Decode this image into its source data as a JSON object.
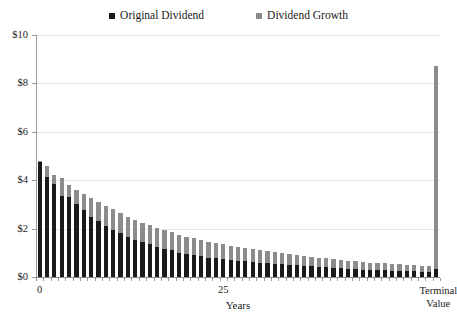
{
  "chart_data": {
    "type": "bar",
    "title": "",
    "xlabel": "Years",
    "ylabel": "",
    "stacked": true,
    "grid": true,
    "legend_position": "top-center",
    "ylim": [
      0,
      10
    ],
    "yticks": [
      0,
      2,
      4,
      6,
      8,
      10
    ],
    "ytick_labels": [
      "$0",
      "$2",
      "$4",
      "$6",
      "$8",
      "$10"
    ],
    "xtick_positions": [
      0,
      25,
      54
    ],
    "xtick_labels": [
      "0",
      "25",
      "Terminal Value"
    ],
    "terminal_label_line1": "Terminal",
    "terminal_label_line2": "Value",
    "series": [
      {
        "name": "Original Dividend",
        "color": "#1a1a1a",
        "values": [
          4.75,
          4.15,
          3.85,
          3.35,
          3.3,
          3.0,
          2.75,
          2.5,
          2.3,
          2.1,
          1.95,
          1.8,
          1.65,
          1.55,
          1.45,
          1.35,
          1.25,
          1.15,
          1.1,
          1.0,
          0.95,
          0.9,
          0.85,
          0.8,
          0.78,
          0.75,
          0.72,
          0.68,
          0.65,
          0.62,
          0.6,
          0.58,
          0.55,
          0.53,
          0.5,
          0.48,
          0.46,
          0.44,
          0.42,
          0.4,
          0.38,
          0.36,
          0.34,
          0.32,
          0.3,
          0.29,
          0.28,
          0.27,
          0.26,
          0.25,
          0.24,
          0.23,
          0.22,
          0.21,
          0.35
        ]
      },
      {
        "name": "Dividend Growth",
        "color": "#8c8c8c",
        "values": [
          0.05,
          0.45,
          0.35,
          0.75,
          0.5,
          0.6,
          0.7,
          0.75,
          0.8,
          0.85,
          0.85,
          0.85,
          0.85,
          0.82,
          0.8,
          0.78,
          0.78,
          0.78,
          0.75,
          0.75,
          0.72,
          0.7,
          0.68,
          0.66,
          0.62,
          0.6,
          0.58,
          0.57,
          0.55,
          0.53,
          0.5,
          0.48,
          0.47,
          0.45,
          0.44,
          0.42,
          0.41,
          0.4,
          0.38,
          0.37,
          0.36,
          0.35,
          0.34,
          0.33,
          0.32,
          0.31,
          0.3,
          0.29,
          0.28,
          0.27,
          0.26,
          0.25,
          0.24,
          0.23,
          8.35
        ]
      }
    ],
    "bar_count": 55,
    "terminal_bar_index": 54,
    "terminal_bar_total": 8.7
  },
  "legend": {
    "entries": [
      {
        "label": "Original Dividend",
        "color": "#1a1a1a"
      },
      {
        "label": "Dividend Growth",
        "color": "#8c8c8c"
      }
    ]
  }
}
